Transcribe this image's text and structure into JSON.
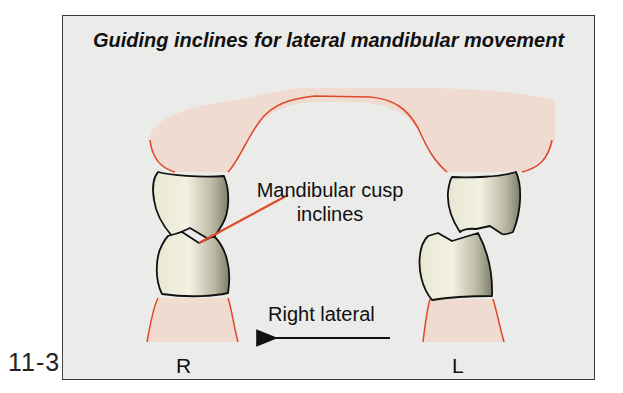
{
  "figure": {
    "number": "11-3",
    "title": "Guiding inclines for lateral mandibular movement"
  },
  "labels": {
    "callout": "Mandibular cusp inclines",
    "direction": "Right lateral",
    "right_side": "R",
    "left_side": "L"
  },
  "colors": {
    "background": "#ebebea",
    "gingiva_fill": "#f0d8cc",
    "gingiva_outline": "#e0482a",
    "tooth_fill_light": "#efeedd",
    "tooth_fill_dark": "#8c8c78",
    "outline": "#111111",
    "leader_line": "#e04a2c"
  }
}
